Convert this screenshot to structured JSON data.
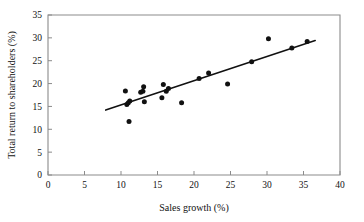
{
  "chart_data": {
    "type": "scatter",
    "title": "",
    "xlabel": "Sales growth (%)",
    "ylabel": "Total return to shareholders (%)",
    "xlim": [
      0,
      40
    ],
    "ylim": [
      0,
      35
    ],
    "xticks": [
      0,
      5,
      10,
      15,
      20,
      25,
      30,
      35,
      40
    ],
    "yticks": [
      0,
      5,
      10,
      15,
      20,
      25,
      30,
      35
    ],
    "grid": false,
    "legend": null,
    "marker_color": "#111111",
    "line_color": "#111111",
    "frame_color": "#8b8b8b",
    "points": [
      {
        "x": 10.6,
        "y": 18.4
      },
      {
        "x": 10.8,
        "y": 15.4
      },
      {
        "x": 11.0,
        "y": 15.8
      },
      {
        "x": 11.2,
        "y": 16.2
      },
      {
        "x": 11.1,
        "y": 11.7
      },
      {
        "x": 12.7,
        "y": 18.1
      },
      {
        "x": 13.1,
        "y": 19.3
      },
      {
        "x": 13.0,
        "y": 18.3
      },
      {
        "x": 13.2,
        "y": 16.0
      },
      {
        "x": 15.6,
        "y": 16.9
      },
      {
        "x": 15.8,
        "y": 19.8
      },
      {
        "x": 16.2,
        "y": 18.3
      },
      {
        "x": 16.5,
        "y": 18.9
      },
      {
        "x": 18.3,
        "y": 15.8
      },
      {
        "x": 20.7,
        "y": 21.1
      },
      {
        "x": 22.0,
        "y": 22.3
      },
      {
        "x": 24.6,
        "y": 19.9
      },
      {
        "x": 27.9,
        "y": 24.8
      },
      {
        "x": 30.2,
        "y": 29.8
      },
      {
        "x": 33.4,
        "y": 27.8
      },
      {
        "x": 35.5,
        "y": 29.2
      }
    ],
    "trend_line": {
      "x0": 7.9,
      "y0": 14.2,
      "x1": 36.6,
      "y1": 29.4
    }
  }
}
